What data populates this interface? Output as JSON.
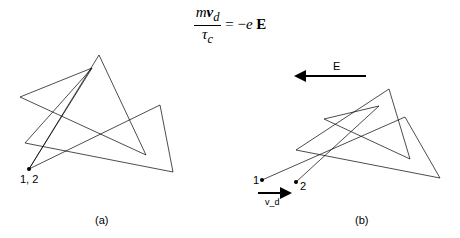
{
  "equation": {
    "numerator": "mv_d",
    "denominator": "τ_c",
    "rhs": "= −e E"
  },
  "panel_a": {
    "caption": "(a)",
    "point_label": "1, 2"
  },
  "panel_b": {
    "caption": "(b)",
    "field_label": "E",
    "point1": "1",
    "point2": "2",
    "drift_label": "v_d"
  }
}
